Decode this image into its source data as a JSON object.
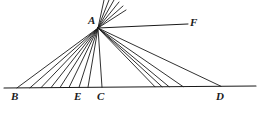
{
  "figure": {
    "type": "geometry-diagram",
    "width": 260,
    "height": 114,
    "stroke_color": "#1a1a1a",
    "background_color": "#ffffff",
    "stroke_width": 0.9,
    "points": {
      "A": {
        "label": "A",
        "x": 98,
        "y": 28,
        "label_x": 88,
        "label_y": 15
      },
      "B": {
        "label": "B",
        "x": 17,
        "y": 87,
        "label_x": 11,
        "label_y": 91
      },
      "E": {
        "label": "E",
        "x": 79,
        "y": 87,
        "label_x": 74,
        "label_y": 91
      },
      "C": {
        "label": "C",
        "x": 102,
        "y": 87,
        "label_x": 97,
        "label_y": 91
      },
      "D": {
        "label": "D",
        "x": 221,
        "y": 87,
        "label_x": 216,
        "label_y": 91
      },
      "F": {
        "label": "F",
        "x": 188,
        "y": 24,
        "label_x": 190,
        "label_y": 17
      }
    },
    "baseline": {
      "x1": 4,
      "y1": 88,
      "x2": 256,
      "y2": 86
    },
    "ray_AF": {
      "x1": 98,
      "y1": 28,
      "x2": 188,
      "y2": 24
    },
    "left_fan_base_x": [
      17,
      30,
      41,
      51,
      60,
      69,
      79,
      88
    ],
    "right_fan_base_x": [
      155,
      162,
      169,
      183,
      221
    ],
    "vertical_ray_base_x": [
      102
    ],
    "upper_fan_end": [
      {
        "x": 104,
        "y": 0
      },
      {
        "x": 109,
        "y": 0
      },
      {
        "x": 114,
        "y": 0
      },
      {
        "x": 119,
        "y": 2
      },
      {
        "x": 123,
        "y": 6
      },
      {
        "x": 126,
        "y": 10
      }
    ]
  }
}
